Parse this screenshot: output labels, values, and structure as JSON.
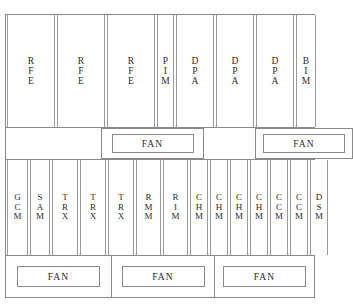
{
  "diagram": {
    "frame_color": "#8a8a8a",
    "card_border_color": "#9b9b9b",
    "background_color": "#ffffff",
    "text_color": "#2b2b2b"
  },
  "shelves": [
    {
      "name": "upper-card-shelf",
      "cards": [
        {
          "label": "RFE",
          "letters": [
            "R",
            "F",
            "E"
          ],
          "width": 48
        },
        {
          "label": "RFE",
          "letters": [
            "R",
            "F",
            "E"
          ],
          "width": 48
        },
        {
          "label": "RFE",
          "letters": [
            "R",
            "F",
            "E"
          ],
          "width": 48
        },
        {
          "label": "PIM",
          "letters": [
            "P",
            "I",
            "M"
          ],
          "width": 17
        },
        {
          "label": "DPA",
          "letters": [
            "D",
            "P",
            "A"
          ],
          "width": 38
        },
        {
          "label": "DPA",
          "letters": [
            "D",
            "P",
            "A"
          ],
          "width": 38
        },
        {
          "label": "DPA",
          "letters": [
            "D",
            "P",
            "A"
          ],
          "width": 38
        },
        {
          "label": "BIM",
          "letters": [
            "B",
            "I",
            "M"
          ],
          "width": 20
        }
      ]
    },
    {
      "name": "lower-card-shelf",
      "cards": [
        {
          "label": "GCM",
          "letters": [
            "G",
            "C",
            "M"
          ],
          "width": 21
        },
        {
          "label": "SAM",
          "letters": [
            "S",
            "A",
            "M"
          ],
          "width": 20
        },
        {
          "label": "TRX",
          "letters": [
            "T",
            "R",
            "X"
          ],
          "width": 26
        },
        {
          "label": "TRX",
          "letters": [
            "T",
            "R",
            "X"
          ],
          "width": 26
        },
        {
          "label": "TRX",
          "letters": [
            "T",
            "R",
            "X"
          ],
          "width": 26
        },
        {
          "label": "RMM",
          "letters": [
            "R",
            "M",
            "M"
          ],
          "width": 25
        },
        {
          "label": "RIM",
          "letters": [
            "R",
            "I",
            "M"
          ],
          "width": 25
        },
        {
          "label": "CHM",
          "letters": [
            "C",
            "H",
            "M"
          ],
          "width": 18
        },
        {
          "label": "CHM",
          "letters": [
            "C",
            "H",
            "M"
          ],
          "width": 18
        },
        {
          "label": "CHM",
          "letters": [
            "C",
            "H",
            "M"
          ],
          "width": 18
        },
        {
          "label": "CHM",
          "letters": [
            "C",
            "H",
            "M"
          ],
          "width": 18
        },
        {
          "label": "CCM",
          "letters": [
            "C",
            "C",
            "M"
          ],
          "width": 18
        },
        {
          "label": "CCM",
          "letters": [
            "C",
            "C",
            "M"
          ],
          "width": 18
        },
        {
          "label": "DSM",
          "letters": [
            "D",
            "S",
            "M"
          ],
          "width": 18
        }
      ]
    }
  ],
  "fan_trays": [
    {
      "name": "upper-fan-tray",
      "lead_gutter": 95,
      "bays": [
        {
          "label": "FAN",
          "bay_width": 103,
          "unit_width": 82,
          "boxed": true,
          "divider_right": false
        },
        {
          "label": "FAN",
          "bay_width": 98,
          "unit_width": 82,
          "boxed": true,
          "divider_right": false
        }
      ],
      "gap_between_bays": 51
    },
    {
      "name": "lower-fan-tray",
      "lead_gutter": 0,
      "bays": [
        {
          "label": "FAN",
          "bay_width": 106,
          "unit_width": 83,
          "boxed": false,
          "divider_right": true
        },
        {
          "label": "FAN",
          "bay_width": 103,
          "unit_width": 83,
          "boxed": false,
          "divider_right": true
        },
        {
          "label": "FAN",
          "bay_width": 99,
          "unit_width": 83,
          "boxed": false,
          "divider_right": false
        }
      ],
      "gap_between_bays": 0
    }
  ]
}
